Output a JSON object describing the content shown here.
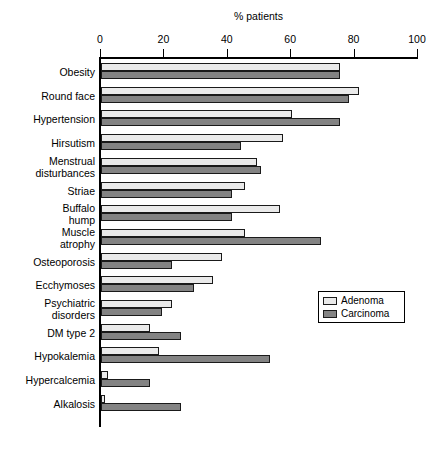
{
  "chart_data": {
    "type": "bar",
    "orientation": "horizontal",
    "title": "% patients",
    "xlabel": "% patients",
    "ylabel": "",
    "xlim": [
      0,
      100
    ],
    "xticks": [
      0,
      20,
      40,
      60,
      80,
      100
    ],
    "xtick_labels": [
      "0",
      "20",
      "40",
      "60",
      "80",
      "100"
    ],
    "grid": false,
    "legend_position": "center-right",
    "categories": [
      "Obesity",
      "Round face",
      "Hypertension",
      "Hirsutism",
      "Menstrual\ndisturbances",
      "Striae",
      "Buffalo\nhump",
      "Muscle\natrophy",
      "Osteoporosis",
      "Ecchymoses",
      "Psychiatric\ndisorders",
      "DM type 2",
      "Hypokalemia",
      "Hypercalcemia",
      "Alkalosis"
    ],
    "series": [
      {
        "name": "Adenoma",
        "color": "#eaeaea",
        "values": [
          75,
          81,
          60,
          57,
          49,
          45,
          56,
          45,
          38,
          35,
          22,
          15,
          18,
          2,
          1
        ]
      },
      {
        "name": "Carcinoma",
        "color": "#838383",
        "values": [
          75,
          78,
          75,
          44,
          50,
          41,
          41,
          69,
          22,
          29,
          19,
          25,
          53,
          15,
          25
        ]
      }
    ]
  },
  "legend": {
    "entries": [
      {
        "label": "Adenoma"
      },
      {
        "label": "Carcinoma"
      }
    ]
  },
  "colors": {
    "adenoma": "#eaeaea",
    "carcinoma": "#838383",
    "axis": "#000000",
    "background": "#ffffff"
  }
}
